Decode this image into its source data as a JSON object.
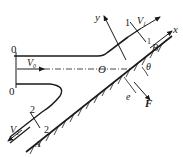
{
  "diagram": {
    "type": "fluid jet impinging on inclined plate",
    "labels": {
      "section0_top": "0",
      "section0_bottom": "0",
      "v0": "V",
      "v0_sub": "0",
      "origin": "O",
      "y_axis": "y",
      "x_axis": "x",
      "section1_a": "1",
      "section1_b": "1",
      "v1": "V",
      "v1_sub": "1",
      "point_b": "B",
      "angle": "θ",
      "offset": "e",
      "force": "F",
      "section2_a": "2",
      "section2_b": "2",
      "v2": "V",
      "v2_sub": "2",
      "point_a": "A"
    },
    "colors": {
      "line": "#1a1a1a",
      "background": "#ffffff"
    }
  }
}
